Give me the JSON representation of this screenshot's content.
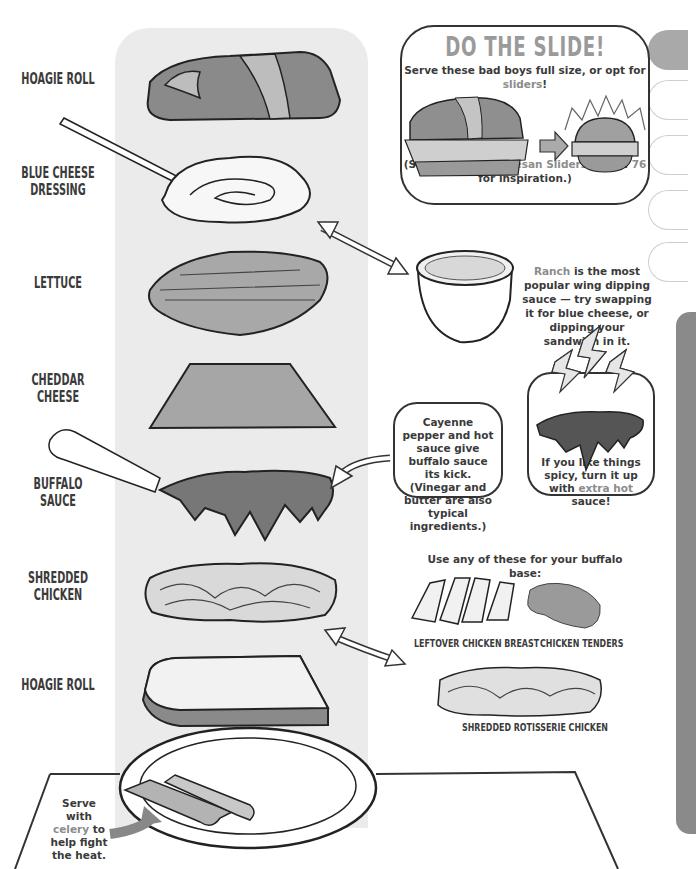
{
  "layers": [
    {
      "label": "HOAGIE ROLL",
      "id": "hoagie-roll-top"
    },
    {
      "label": "BLUE CHEESE DRESSING",
      "id": "blue-cheese-dressing"
    },
    {
      "label": "LETTUCE",
      "id": "lettuce"
    },
    {
      "label": "CHEDDAR CHEESE",
      "id": "cheddar-cheese"
    },
    {
      "label": "BUFFALO SAUCE",
      "id": "buffalo-sauce"
    },
    {
      "label": "SHREDDED CHICKEN",
      "id": "shredded-chicken"
    },
    {
      "label": "HOAGIE ROLL",
      "id": "hoagie-roll-bottom"
    }
  ],
  "slide_box": {
    "title": "DO THE SLIDE!",
    "subtitle_pre": "Serve these bad boys full size, or opt for ",
    "subtitle_hl": "sliders",
    "subtitle_post": "!",
    "ref_pre": "(See ",
    "ref_hl": "Chicken Parmesan Sliders",
    "ref_mid": " on pg. ",
    "ref_page": "76",
    "ref_post": "for inspiration.)"
  },
  "ranch_note": {
    "hl": "Ranch",
    "text": " is the most popular wing dipping sauce — try swapping it for blue cheese, or dipping your sandwich in it."
  },
  "cayenne_note": {
    "text": "Cayenne pepper and hot sauce give buffalo sauce its kick. (Vinegar and butter are also typical ingredients.)"
  },
  "spicy_note": {
    "pre": "If you like things spicy, turn it up with ",
    "hl": "extra hot",
    "post": " sauce!"
  },
  "base_options": {
    "heading": "Use any of these for your buffalo base:",
    "items": [
      {
        "label": "LEFTOVER CHICKEN BREAST"
      },
      {
        "label": "CHICKEN TENDERS"
      },
      {
        "label": "SHREDDED ROTISSERIE CHICKEN"
      }
    ]
  },
  "celery_note": {
    "pre": "Serve with ",
    "hl": "celery",
    "post": " to help fight the heat."
  },
  "colors": {
    "layer_column_bg": "#ebebeb",
    "highlight_text": "#8c8c8c",
    "title_gray": "#9a9a9a",
    "ink": "#333333",
    "tab_fill": "#a9a9a9",
    "sidebar_panel": "#8a8a8a"
  }
}
